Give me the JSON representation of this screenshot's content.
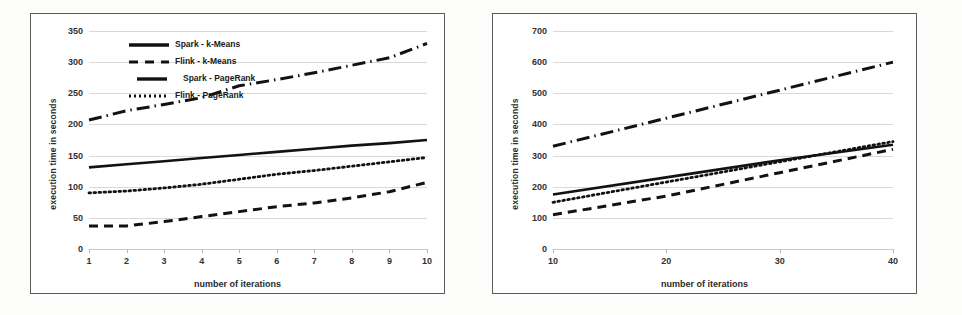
{
  "charts": [
    {
      "id": "left",
      "ylabel": "execution  time  in  seconds",
      "xlabel": "number of iterations",
      "yticks": [
        "0",
        "50",
        "100",
        "150",
        "200",
        "250",
        "300",
        "350"
      ],
      "xticks": [
        "1",
        "2",
        "3",
        "4",
        "5",
        "6",
        "7",
        "8",
        "9",
        "10"
      ],
      "legend": [
        {
          "label": "Spark - k-Means",
          "style": "solid-thick"
        },
        {
          "label": "Flink - k-Means",
          "style": "dashed"
        },
        {
          "label": "Spark - PageRank",
          "style": "dashdot"
        },
        {
          "label": "Flink - PageRank",
          "style": "dotted"
        }
      ]
    },
    {
      "id": "right",
      "ylabel": "execution  time  in  seconds",
      "xlabel": "number of iterations",
      "yticks": [
        "0",
        "100",
        "200",
        "300",
        "400",
        "500",
        "600",
        "700"
      ],
      "xticks": [
        "10",
        "20",
        "30",
        "40"
      ],
      "legend": [
        {
          "label": "Spark - k-Means",
          "style": "solid-thick"
        },
        {
          "label": "Flink - k-Means",
          "style": "dashed"
        },
        {
          "label": "Spark - PageRank",
          "style": "dashdot"
        },
        {
          "label": "Flink - PageRank",
          "style": "dotted"
        }
      ]
    }
  ],
  "chart_data": [
    {
      "type": "line",
      "title": "",
      "xlabel": "number of iterations",
      "ylabel": "execution time in seconds",
      "x": [
        1,
        2,
        3,
        4,
        5,
        6,
        7,
        8,
        9,
        10
      ],
      "xlim": [
        1,
        10
      ],
      "ylim": [
        0,
        350
      ],
      "ytick_step": 50,
      "grid": true,
      "legend_position": "top-left-inside",
      "series": [
        {
          "name": "Spark - k-Means",
          "style": "solid-thick",
          "values": [
            131,
            136,
            141,
            146,
            151,
            156,
            161,
            166,
            170,
            175
          ]
        },
        {
          "name": "Flink - k-Means",
          "style": "dashed",
          "values": [
            37,
            37,
            44,
            52,
            60,
            68,
            74,
            82,
            92,
            107
          ]
        },
        {
          "name": "Spark - PageRank",
          "style": "dashdot",
          "values": [
            207,
            222,
            232,
            243,
            262,
            272,
            283,
            295,
            307,
            330
          ]
        },
        {
          "name": "Flink - PageRank",
          "style": "dotted",
          "values": [
            90,
            93,
            98,
            104,
            112,
            120,
            126,
            133,
            140,
            147
          ]
        }
      ]
    },
    {
      "type": "line",
      "title": "",
      "xlabel": "number of iterations",
      "ylabel": "execution time in seconds",
      "x": [
        10,
        20,
        30,
        40
      ],
      "xlim": [
        10,
        40
      ],
      "ylim": [
        0,
        700
      ],
      "ytick_step": 100,
      "grid": true,
      "legend_position": "top-left-inside",
      "series": [
        {
          "name": "Spark - k-Means",
          "style": "solid-thick",
          "values": [
            175,
            230,
            285,
            335
          ]
        },
        {
          "name": "Flink - k-Means",
          "style": "dashed",
          "values": [
            110,
            170,
            245,
            320
          ]
        },
        {
          "name": "Spark - PageRank",
          "style": "dashdot",
          "values": [
            330,
            420,
            510,
            600
          ]
        },
        {
          "name": "Flink - PageRank",
          "style": "dotted",
          "values": [
            150,
            215,
            280,
            345
          ]
        }
      ]
    }
  ]
}
